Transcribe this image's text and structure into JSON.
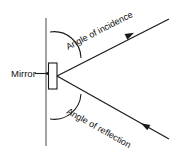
{
  "figure": {
    "background_color": "#ffffff",
    "line_color": "#1a1a1a",
    "surface_color": "#8c8c8c",
    "width": 175,
    "height": 155
  },
  "labels": {
    "mirror": "Mirror",
    "angle_of_incidence": "Angle of incidence",
    "angle_of_reflection": "Angle of reflection"
  },
  "elements": {
    "normal_surface_line_name": "mirror-surface-line",
    "mirror_block_name": "mirror-block",
    "incident_ray_name": "incident-ray",
    "reflected_ray_name": "reflected-ray",
    "incidence_arc_name": "angle-of-incidence-arc",
    "reflection_arc_name": "angle-of-reflection-arc",
    "leader_arrow_name": "mirror-leader-arrow"
  },
  "geometry": {
    "surface_line": {
      "x": 46,
      "y1": 18,
      "y2": 146
    },
    "mirror_block": {
      "x": 48,
      "y": 63,
      "w": 9,
      "h": 26
    },
    "contact_point": {
      "x": 57,
      "y": 76
    },
    "incident_ray_end": {
      "x": 169,
      "y": 19
    },
    "reflected_ray_end": {
      "x": 169,
      "y": 139
    },
    "incident_arrow_at": {
      "x": 137,
      "y": 31
    },
    "reflected_arrow_at": {
      "x": 143,
      "y": 126
    }
  }
}
